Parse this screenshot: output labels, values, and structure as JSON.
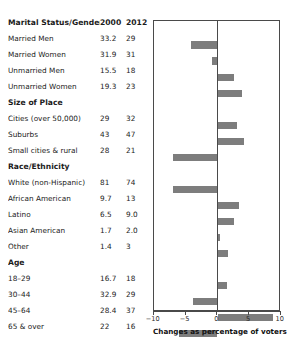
{
  "columns": {
    "label_header": "Marital Status/Gender",
    "year1": "2000",
    "year2": "2012"
  },
  "axis": {
    "caption": "Changes as percentage of voters",
    "ticks": [
      "−10",
      "−5",
      "0",
      "5",
      "10"
    ],
    "tick_values": [
      -10,
      -5,
      0,
      5,
      10
    ],
    "min": -10,
    "max": 10
  },
  "rows": [
    {
      "type": "header",
      "label": "Marital Status/Gender",
      "v1": "2000",
      "v2": "2012",
      "change": null
    },
    {
      "type": "data",
      "label": "Married Men",
      "v1": "33.2",
      "v2": "29",
      "change": -4.2
    },
    {
      "type": "data",
      "label": "Married Women",
      "v1": "31.9",
      "v2": "31",
      "change": -0.9
    },
    {
      "type": "data",
      "label": "Unmarried Men",
      "v1": "15.5",
      "v2": "18",
      "change": 2.5
    },
    {
      "type": "data",
      "label": "Unmarried Women",
      "v1": "19.3",
      "v2": "23",
      "change": 3.7
    },
    {
      "type": "section",
      "label": "Size of Place",
      "v1": "",
      "v2": "",
      "change": null
    },
    {
      "type": "data",
      "label": "Cities (over 50,000)",
      "v1": "29",
      "v2": "32",
      "change": 3.0
    },
    {
      "type": "data",
      "label": "Suburbs",
      "v1": "43",
      "v2": "47",
      "change": 4.0
    },
    {
      "type": "data",
      "label": "Small cities & rural",
      "v1": "28",
      "v2": "21",
      "change": -7.0
    },
    {
      "type": "section",
      "label": "Race/Ethnicity",
      "v1": "",
      "v2": "",
      "change": null
    },
    {
      "type": "data",
      "label": "White (non-Hispanic)",
      "v1": "81",
      "v2": "74",
      "change": -7.0
    },
    {
      "type": "data",
      "label": "African American",
      "v1": "9.7",
      "v2": "13",
      "change": 3.3
    },
    {
      "type": "data",
      "label": "Latino",
      "v1": "6.5",
      "v2": "9.0",
      "change": 2.5
    },
    {
      "type": "data",
      "label": "Asian American",
      "v1": "1.7",
      "v2": "2.0",
      "change": 0.3
    },
    {
      "type": "data",
      "label": "Other",
      "v1": "1.4",
      "v2": "3",
      "change": 1.6
    },
    {
      "type": "section",
      "label": "Age",
      "v1": "",
      "v2": "",
      "change": null
    },
    {
      "type": "data",
      "label": "18–29",
      "v1": "16.7",
      "v2": "18",
      "change": 1.3
    },
    {
      "type": "data",
      "label": "30–44",
      "v1": "32.9",
      "v2": "29",
      "change": -3.9
    },
    {
      "type": "data",
      "label": "45–64",
      "v1": "28.4",
      "v2": "37",
      "change": 8.6
    },
    {
      "type": "data",
      "label": "65 & over",
      "v1": "22",
      "v2": "16",
      "change": -6.0
    }
  ],
  "chart_data": {
    "type": "bar",
    "orientation": "horizontal",
    "title": "",
    "xlabel": "Changes as percentage of voters",
    "ylabel": "",
    "xlim": [
      -10,
      10
    ],
    "grid": false,
    "legend": null,
    "bar_color": "#7d7d7d",
    "categories": [
      "Married Men",
      "Married Women",
      "Unmarried Men",
      "Unmarried Women",
      "Cities (over 50,000)",
      "Suburbs",
      "Small cities & rural",
      "White (non-Hispanic)",
      "African American",
      "Latino",
      "Asian American",
      "Other",
      "18–29",
      "30–44",
      "45–64",
      "65 & over"
    ],
    "values": [
      -4.2,
      -0.9,
      2.5,
      3.7,
      3.0,
      4.0,
      -7.0,
      -7.0,
      3.3,
      2.5,
      0.3,
      1.6,
      1.3,
      -3.9,
      8.6,
      -6.0
    ],
    "series": [
      {
        "name": "2000",
        "values": [
          33.2,
          31.9,
          15.5,
          19.3,
          29,
          43,
          28,
          81,
          9.7,
          6.5,
          1.7,
          1.4,
          16.7,
          32.9,
          28.4,
          22
        ]
      },
      {
        "name": "2012",
        "values": [
          29,
          31,
          18,
          23,
          32,
          47,
          21,
          74,
          13,
          9.0,
          2.0,
          3,
          18,
          29,
          37,
          16
        ]
      }
    ]
  }
}
